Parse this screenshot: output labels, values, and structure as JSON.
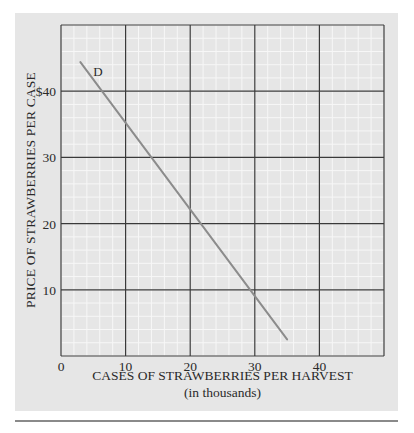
{
  "chart_data": {
    "type": "line",
    "title": "",
    "xlabel": "CASES OF STRAWBERRIES PER HARVEST",
    "xlabel_sub": "(in thousands)",
    "ylabel": "PRICE OF STRAWBERRIES PER CASE",
    "xlim": [
      0,
      50
    ],
    "ylim": [
      0,
      50
    ],
    "x_ticks": [
      0,
      10,
      20,
      30,
      40
    ],
    "x_tick_labels": [
      "0",
      "10",
      "20",
      "30",
      "40"
    ],
    "y_ticks": [
      10,
      20,
      30,
      40
    ],
    "y_tick_labels": [
      "10",
      "20",
      "30",
      "$40"
    ],
    "grid": true,
    "minor_grid": true,
    "legend": null,
    "series": [
      {
        "name": "D",
        "label": "D",
        "color": "#8c8c8c",
        "points": [
          {
            "x": 3,
            "y": 44.4
          },
          {
            "x": 10,
            "y": 35
          },
          {
            "x": 20,
            "y": 22
          },
          {
            "x": 30,
            "y": 8.5
          },
          {
            "x": 35,
            "y": 2.5
          }
        ]
      }
    ],
    "annotations": [
      {
        "text": "D",
        "x": 5.7,
        "y": 43
      }
    ]
  },
  "colors": {
    "panel_bg": "#e6e6e6",
    "major_grid": "#3a3a3a",
    "minor_grid": "#f7f7f7",
    "curve": "#8c8c8c",
    "divider": "#8a8a8a"
  }
}
